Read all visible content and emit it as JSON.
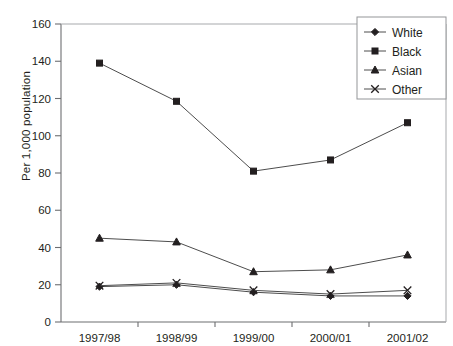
{
  "chart_data": {
    "type": "line",
    "title": "",
    "xlabel": "",
    "ylabel": "Per 1,000 population",
    "categories": [
      "1997/98",
      "1998/99",
      "1999/00",
      "2000/01",
      "2001/02"
    ],
    "ylim": [
      0,
      160
    ],
    "ytick_step": 20,
    "yticks": [
      0,
      20,
      40,
      60,
      80,
      100,
      120,
      140,
      160
    ],
    "ytick_labels": [
      "0",
      "20",
      "40",
      "60",
      "80",
      "100",
      "120",
      "140",
      "160"
    ],
    "grid": false,
    "legend_position": "top-right",
    "series": [
      {
        "name": "White",
        "marker": "diamond",
        "values": [
          19,
          20,
          16,
          14,
          14
        ]
      },
      {
        "name": "Black",
        "marker": "square",
        "values": [
          139,
          118.5,
          81,
          87,
          107
        ]
      },
      {
        "name": "Asian",
        "marker": "triangle",
        "values": [
          45,
          43,
          27,
          28,
          36
        ]
      },
      {
        "name": "Other",
        "marker": "cross",
        "values": [
          19.5,
          21,
          17,
          15,
          17
        ]
      }
    ]
  },
  "legend": {
    "items": [
      {
        "label": "White"
      },
      {
        "label": "Black"
      },
      {
        "label": "Asian"
      },
      {
        "label": "Other"
      }
    ]
  }
}
